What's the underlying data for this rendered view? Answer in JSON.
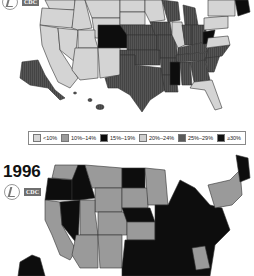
{
  "top_map": {
    "year_label": "",
    "logos": {
      "hhs": "hhs-eagle-logo",
      "cdc": "CDC"
    }
  },
  "bottom_map": {
    "year_label": "1996",
    "logos": {
      "hhs": "hhs-eagle-logo",
      "cdc": "CDC"
    }
  },
  "legend": {
    "items": [
      {
        "label": "<10%",
        "color": "#d6d6d6"
      },
      {
        "label": "10%–14%",
        "color": "#9a9a9a"
      },
      {
        "label": "15%–19%",
        "color": "#0a0a0a"
      },
      {
        "label": "20%–24%",
        "color": "#cfcfcf"
      },
      {
        "label": "25%–29%",
        "color": "#5a5a5a"
      },
      {
        "label": "≥30%",
        "color": "#111111"
      }
    ]
  },
  "colors": {
    "light": "#d4d4d4",
    "mid": "#9a9a9a",
    "dark_stripe": "#555555",
    "black": "#0d0d0d",
    "border": "#333333"
  }
}
